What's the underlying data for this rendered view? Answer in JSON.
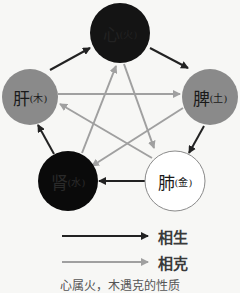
{
  "nodes": [
    {
      "id": "heart",
      "organ": "心",
      "element": "(火)",
      "fill": "#141414",
      "text_color": "#222222"
    },
    {
      "id": "spleen",
      "organ": "脾",
      "element": "(土)",
      "fill": "#8a8a8a",
      "text_color": "#1a1a1a"
    },
    {
      "id": "lung",
      "organ": "肺",
      "element": "(金)",
      "fill": "#ffffff",
      "text_color": "#1a1a1a"
    },
    {
      "id": "kidney",
      "organ": "肾",
      "element": "(水)",
      "fill": "#0a0a0a",
      "text_color": "#2a2a2a"
    },
    {
      "id": "liver",
      "organ": "肝",
      "element": "(木)",
      "fill": "#8a8a8a",
      "text_color": "#1a1a1a"
    }
  ],
  "legend": {
    "generate_label": "相生",
    "restrain_label": "相克",
    "generate_color": "#222222",
    "restrain_color": "#a0a0a0"
  },
  "caption": "心属火，木遇克的性质"
}
